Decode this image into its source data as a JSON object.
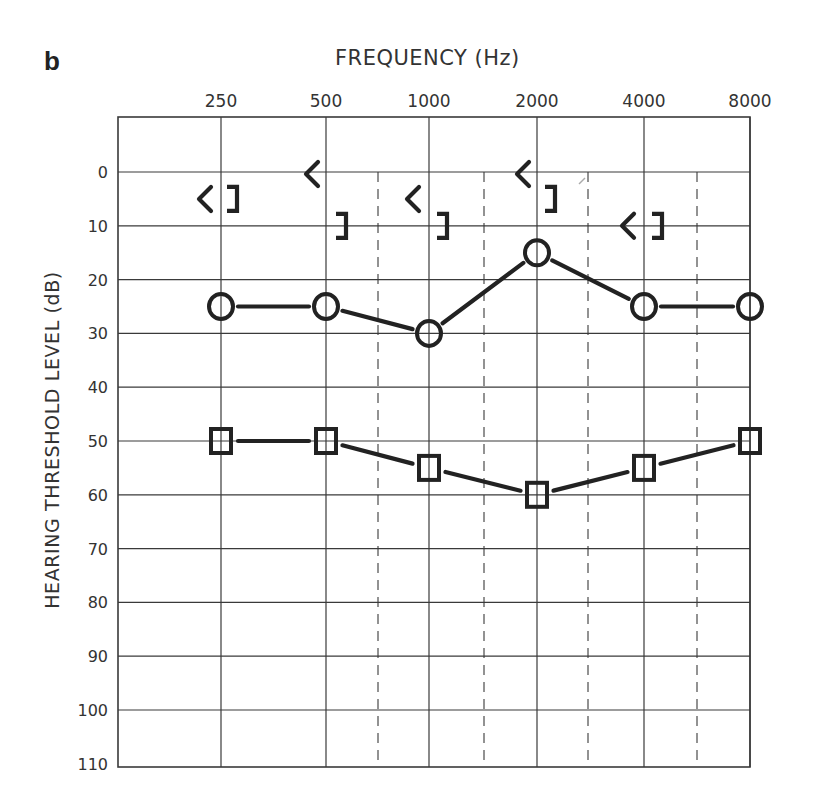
{
  "figure": {
    "panel_label": "b",
    "title": "FREQUENCY (Hz)",
    "ylabel": "HEARING THRESHOLD LEVEL (dB)"
  },
  "chart_data": {
    "type": "line",
    "title": "FREQUENCY (Hz)",
    "xlabel": "FREQUENCY (Hz)",
    "ylabel": "HEARING THRESHOLD LEVEL (dB)",
    "categories": [
      "250",
      "500",
      "1000",
      "2000",
      "4000",
      "8000"
    ],
    "x": [
      250,
      500,
      1000,
      2000,
      4000,
      8000
    ],
    "yticks": [
      "0",
      "10",
      "20",
      "30",
      "40",
      "50",
      "60",
      "70",
      "80",
      "90",
      "100",
      "110"
    ],
    "ylim": [
      -10,
      110
    ],
    "y_inverted": true,
    "grid": true,
    "interoctave_dashed_lines": [
      750,
      1500,
      3000,
      6000
    ],
    "series": [
      {
        "name": "Air conduction (circle, O)",
        "marker": "circle",
        "connected": true,
        "values": [
          25,
          25,
          30,
          15,
          25,
          25
        ]
      },
      {
        "name": "Air conduction (square, □)",
        "marker": "square",
        "connected": true,
        "values": [
          50,
          50,
          55,
          60,
          55,
          50
        ]
      },
      {
        "name": "Masked bone conduction (<)",
        "marker": "<",
        "connected": false,
        "values": [
          5,
          0,
          5,
          0,
          10,
          null
        ]
      },
      {
        "name": "Masked bone conduction (])",
        "marker": "]",
        "connected": false,
        "values": [
          5,
          10,
          10,
          5,
          10,
          null
        ]
      }
    ]
  }
}
